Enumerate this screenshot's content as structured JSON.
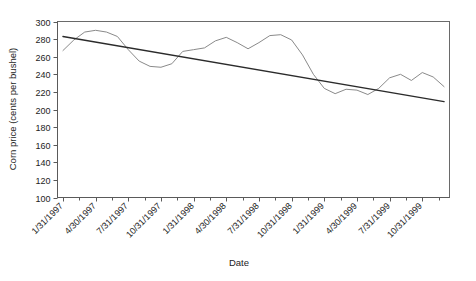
{
  "chart_data": {
    "type": "line",
    "title": "",
    "xlabel": "Date",
    "ylabel": "Corn price (cents per bushel)",
    "ylim": [
      100,
      300
    ],
    "ytick_step": 20,
    "yticks": [
      100,
      120,
      140,
      160,
      180,
      200,
      220,
      240,
      260,
      280,
      300
    ],
    "grid": false,
    "legend": "none",
    "xtick_labels": [
      "1/31/1997",
      "4/30/1997",
      "7/31/1997",
      "10/31/1997",
      "1/31/1998",
      "4/30/1998",
      "7/31/1998",
      "10/31/1998",
      "1/31/1999",
      "4/30/1999",
      "7/31/1999",
      "10/31/1999"
    ],
    "x_minor_ticks_per_label": 1,
    "series": [
      {
        "name": "Corn price",
        "color": "#8a8a8a",
        "x": [
          "1/31/1997",
          "2/28/1997",
          "3/31/1997",
          "4/30/1997",
          "5/31/1997",
          "6/30/1997",
          "7/31/1997",
          "8/31/1997",
          "9/30/1997",
          "10/31/1997",
          "11/30/1997",
          "12/31/1997",
          "1/31/1998",
          "2/28/1998",
          "3/31/1998",
          "4/30/1998",
          "5/31/1998",
          "6/30/1998",
          "7/31/1998",
          "8/31/1998",
          "9/30/1998",
          "10/31/1998",
          "11/30/1998",
          "12/31/1998",
          "1/31/1999",
          "2/28/1999",
          "3/31/1999",
          "4/30/1999",
          "5/31/1999",
          "6/30/1999",
          "7/31/1999",
          "8/31/1999",
          "9/30/1999",
          "10/31/1999",
          "11/30/1999",
          "12/31/1999"
        ],
        "values": [
          267,
          279,
          288,
          290,
          288,
          283,
          268,
          255,
          249,
          248,
          252,
          266,
          268,
          270,
          278,
          282,
          276,
          269,
          276,
          284,
          285,
          279,
          262,
          240,
          224,
          218,
          223,
          222,
          217,
          224,
          236,
          240,
          233,
          242,
          237,
          226
        ]
      }
    ],
    "trendline": {
      "name": "Linear trend",
      "color": "#2b2b2b",
      "start_value": 283,
      "end_value": 209
    }
  }
}
